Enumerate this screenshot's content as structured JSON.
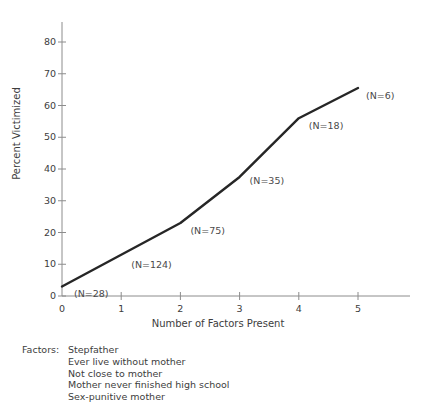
{
  "chart_data": {
    "type": "line",
    "title": "",
    "xlabel": "Number of Factors Present",
    "ylabel": "Percent Victimized",
    "x": [
      0,
      1,
      2,
      3,
      4,
      5
    ],
    "values": [
      3,
      13,
      23,
      37.5,
      56,
      65.5
    ],
    "xlim": [
      0,
      5
    ],
    "ylim": [
      0,
      80
    ],
    "xticks": [
      "0",
      "1",
      "2",
      "3",
      "4",
      "5"
    ],
    "yticks": [
      "0",
      "10",
      "20",
      "30",
      "40",
      "50",
      "60",
      "70",
      "80"
    ],
    "grid": false,
    "legend": null,
    "series_color": "#262626",
    "axis_color": "#8c8c8c",
    "annotations": [
      {
        "label": "(N=28)",
        "x": 0,
        "y": 3
      },
      {
        "label": "(N=124)",
        "x": 1,
        "y": 13
      },
      {
        "label": "(N=75)",
        "x": 2,
        "y": 23
      },
      {
        "label": "(N=35)",
        "x": 3,
        "y": 37.5
      },
      {
        "label": "(N=18)",
        "x": 4,
        "y": 56
      },
      {
        "label": "(N=6)",
        "x": 5,
        "y": 65.5
      }
    ]
  },
  "footnote": {
    "title": "Factors:",
    "items": [
      "Stepfather",
      "Ever live without mother",
      "Not close to mother",
      "Mother never finished high school",
      "Sex-punitive mother"
    ]
  }
}
